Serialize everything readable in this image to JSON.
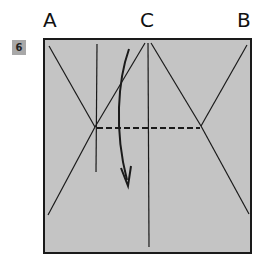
{
  "step": {
    "number": "6"
  },
  "labels": {
    "a": "A",
    "c": "C",
    "b": "B"
  },
  "colors": {
    "paper": "#c4c4c4",
    "line": "#1a1a1a",
    "badge": "#a8a8a8"
  },
  "diagram": {
    "fold_type": "valley-fold",
    "arrow": "curved-fold-arrow"
  }
}
